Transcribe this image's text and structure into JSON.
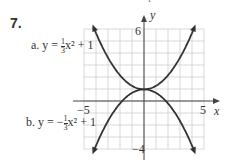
{
  "problem": {
    "number": "7.",
    "top_fragment": "−1"
  },
  "labels": {
    "a": {
      "prefix": "a.  y = ",
      "frac_num": "1",
      "frac_den": "3",
      "suffix": "x² + 1"
    },
    "b": {
      "prefix": "b.  y = −",
      "frac_num": "1",
      "frac_den": "3",
      "suffix": "x² + 1"
    }
  },
  "axes": {
    "x_label": "x",
    "y_label": "y",
    "x_min_tick": "−5",
    "x_max_tick": "5",
    "y_max_tick": "6",
    "y_min_tick": "−4"
  },
  "chart_data": {
    "type": "line",
    "title": "",
    "xlabel": "x",
    "ylabel": "y",
    "xlim": [
      -5,
      5
    ],
    "ylim": [
      -4,
      6
    ],
    "grid": true,
    "series": [
      {
        "name": "a. y = (1/3)x² + 1",
        "x": [
          -4,
          -3,
          -2,
          -1,
          0,
          1,
          2,
          3,
          4
        ],
        "values": [
          6.33,
          4,
          2.33,
          1.33,
          1,
          1.33,
          2.33,
          4,
          6.33
        ]
      },
      {
        "name": "b. y = −(1/3)x² + 1",
        "x": [
          -4,
          -3,
          -2,
          -1,
          0,
          1,
          2,
          3,
          4
        ],
        "values": [
          -4.33,
          -2,
          -0.33,
          0.67,
          1,
          0.67,
          -0.33,
          -2,
          -4.33
        ]
      }
    ]
  }
}
